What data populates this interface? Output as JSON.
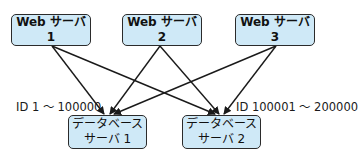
{
  "diagram": {
    "web_servers": [
      {
        "id": "web1",
        "label": "Web サーバ 1"
      },
      {
        "id": "web2",
        "label": "Web サーバ 2"
      },
      {
        "id": "web3",
        "label": "Web サーバ 3"
      }
    ],
    "db_servers": [
      {
        "id": "db1",
        "line1": "データベース",
        "line2": "サーバ 1"
      },
      {
        "id": "db2",
        "line1": "データベース",
        "line2": "サーバ 2"
      }
    ],
    "range_labels": {
      "db1": "ID 1 ～ 100000",
      "db2": "ID 100001 ～ 200000"
    },
    "edges": [
      {
        "from": "web1",
        "to": "db1"
      },
      {
        "from": "web1",
        "to": "db2"
      },
      {
        "from": "web2",
        "to": "db1"
      },
      {
        "from": "web2",
        "to": "db2"
      },
      {
        "from": "web3",
        "to": "db1"
      },
      {
        "from": "web3",
        "to": "db2"
      }
    ],
    "colors": {
      "node_fill": "#cfe9f7",
      "node_border": "#2b2b2b",
      "edge": "#1a1a1a"
    }
  }
}
